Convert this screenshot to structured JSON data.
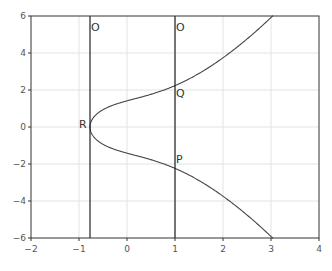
{
  "chart_data": {
    "type": "line",
    "title": "",
    "xlabel": "",
    "ylabel": "",
    "xlim": [
      -2,
      4
    ],
    "ylim": [
      -6,
      6
    ],
    "grid": true,
    "x_ticks": [
      "−2",
      "−1",
      "0",
      "1",
      "2",
      "3",
      "4"
    ],
    "y_ticks": [
      "6",
      "4",
      "2",
      "0",
      "−2",
      "−4",
      "−6"
    ],
    "series": [
      {
        "name": "elliptic curve y² = x³ + 2x + 2",
        "equation": "y^2 = x^3 + 2x + 2",
        "x_range": [
          -0.7709,
          3.04
        ]
      },
      {
        "name": "vertical line x = -0.77",
        "x": -0.7709
      },
      {
        "name": "vertical line x = 1",
        "x": 1
      }
    ],
    "annotations": [
      {
        "label": "O",
        "x": -0.7709,
        "y": 5.6
      },
      {
        "label": "O",
        "x": 1,
        "y": 5.6
      },
      {
        "label": "Q",
        "x": 1,
        "y": 2.236
      },
      {
        "label": "R",
        "x": -0.7709,
        "y": 0
      },
      {
        "label": "P",
        "x": 1,
        "y": -2.236
      }
    ]
  },
  "labels": {
    "o1": "O",
    "o2": "O",
    "q": "Q",
    "r": "R",
    "p": "P"
  },
  "ticks": {
    "x": [
      "−2",
      "−1",
      "0",
      "1",
      "2",
      "3",
      "4"
    ],
    "y": [
      "6",
      "4",
      "2",
      "0",
      "−2",
      "−4",
      "−6"
    ]
  }
}
